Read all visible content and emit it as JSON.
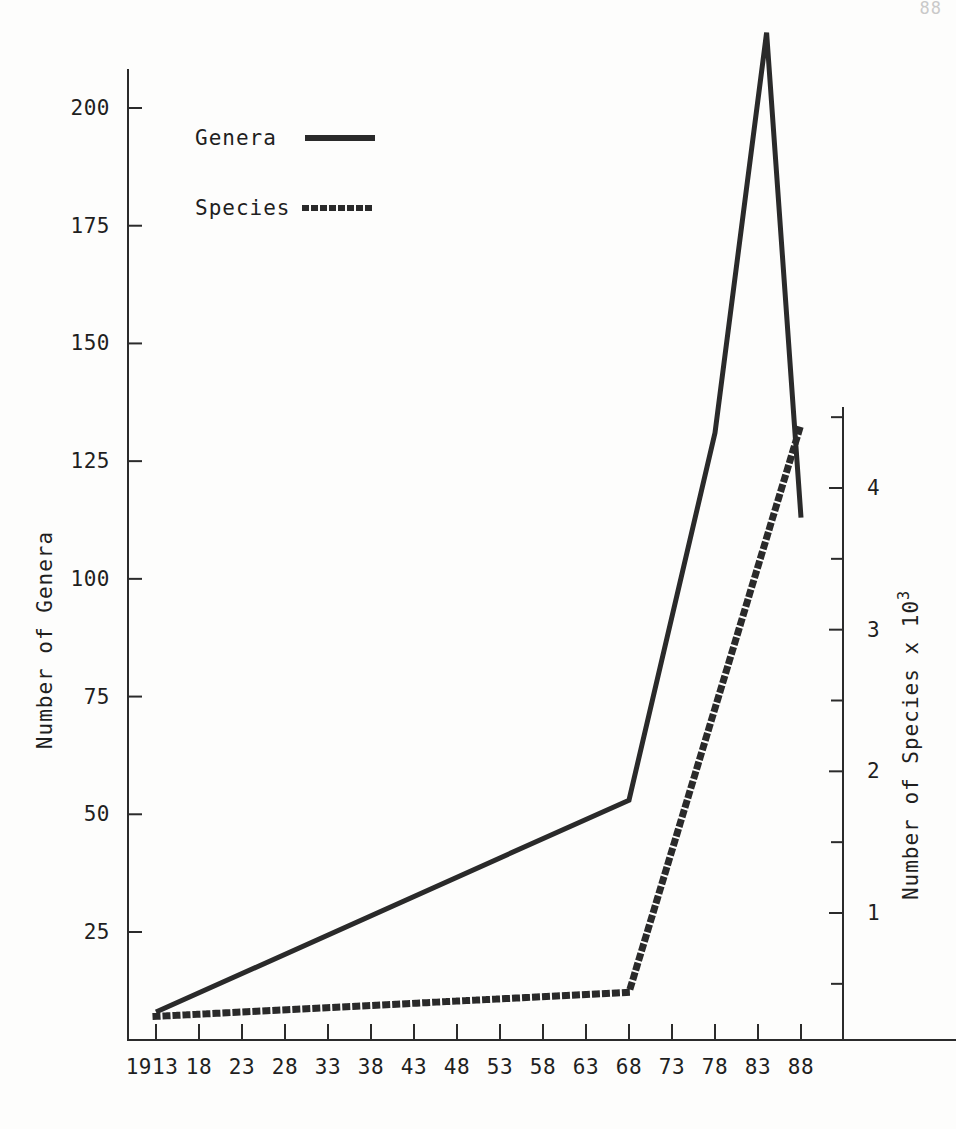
{
  "figure": {
    "background_color": "#fdfdfc",
    "ink_color": "#2a2a2a",
    "corner_artifact": "88"
  },
  "legend": {
    "position": "top-left-inside",
    "entries": [
      {
        "label": "Genera",
        "style": "solid"
      },
      {
        "label": "Species",
        "style": "dotted"
      }
    ]
  },
  "chart_data": {
    "type": "line",
    "title": "",
    "xlabel": "",
    "ylabel": "Number of Genera",
    "y2label": "Number of Species x 10³",
    "grid": false,
    "legend_position": "upper left",
    "x": [
      1913,
      1968,
      1978,
      1984,
      1988
    ],
    "xlim": [
      1913,
      1989
    ],
    "xtick_labels": [
      "1913",
      "18",
      "23",
      "28",
      "33",
      "38",
      "43",
      "48",
      "53",
      "58",
      "63",
      "68",
      "73",
      "78",
      "83",
      "88"
    ],
    "xtick_values": [
      1913,
      1918,
      1923,
      1928,
      1933,
      1938,
      1943,
      1948,
      1953,
      1958,
      1963,
      1968,
      1973,
      1978,
      1983,
      1988
    ],
    "ylim": [
      0,
      220
    ],
    "ytick_labels": [
      "25",
      "50",
      "75",
      "100",
      "125",
      "150",
      "175",
      "200"
    ],
    "ytick_values": [
      25,
      50,
      75,
      100,
      125,
      150,
      175,
      200
    ],
    "y2lim": [
      0,
      4.7
    ],
    "y2tick_labels": [
      "1",
      "2",
      "3",
      "4"
    ],
    "y2tick_values": [
      1,
      2,
      3,
      4
    ],
    "y2_minor_ticks": [
      0.5,
      1.5,
      2.5,
      3.5,
      4.5
    ],
    "series": [
      {
        "name": "Genera",
        "axis": "left",
        "style": "solid",
        "x": [
          1913,
          1968,
          1978,
          1984,
          1988
        ],
        "values": [
          8,
          53,
          131,
          216,
          113
        ]
      },
      {
        "name": "Species",
        "axis": "right",
        "style": "dotted",
        "x": [
          1913,
          1968,
          1988
        ],
        "values": [
          0.27,
          0.44,
          4.45
        ]
      }
    ]
  }
}
